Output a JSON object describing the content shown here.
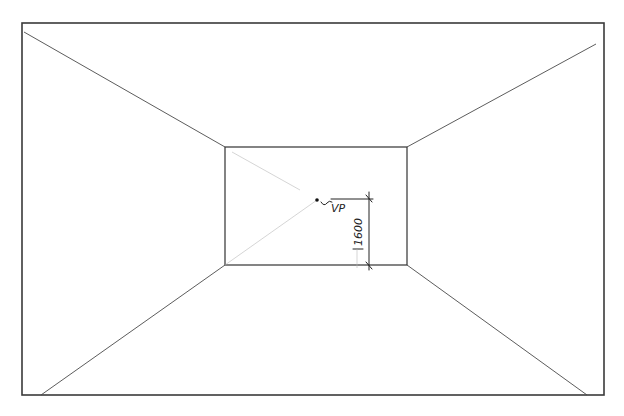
{
  "drawing": {
    "type": "one-point perspective room sketch",
    "header_text_partial": "",
    "vanishing_point_label": "VP",
    "eye_height_dimension": "1600",
    "stroke_color": "#333333",
    "background_color": "#ffffff"
  }
}
